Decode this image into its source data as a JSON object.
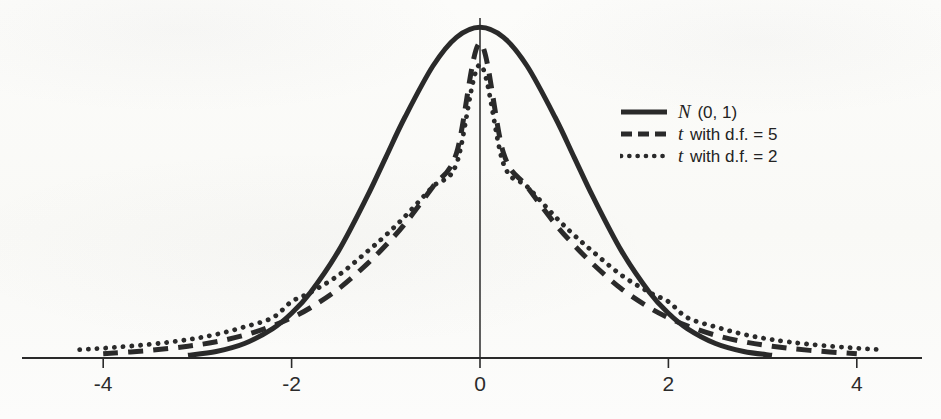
{
  "figure": {
    "ink_color": "#2a2a2a",
    "paper_color": "#fbfbf9"
  },
  "axis": {
    "x_tick_labels": [
      "-4",
      "-2",
      "0",
      "2",
      "4"
    ],
    "x_tick_values": [
      -4,
      -2,
      0,
      2,
      4
    ]
  },
  "legend": {
    "items": [
      {
        "symbol": "N",
        "label": " (0, 1)",
        "style": "solid",
        "dash": "none"
      },
      {
        "symbol": "t",
        "label": " with d.f. = 5",
        "style": "dashed",
        "dash": "14 9"
      },
      {
        "symbol": "t",
        "label": " with d.f. = 2",
        "style": "dotted",
        "dash": "3.5 7"
      }
    ]
  },
  "chart_data": {
    "type": "line",
    "title": "",
    "subtitle": "",
    "xlabel": "",
    "ylabel": "",
    "xlim": [
      -4.9,
      4.7
    ],
    "ylim": [
      0,
      0.41
    ],
    "grid": false,
    "legend_position": "upper right",
    "x_ticks": [
      -4,
      -2,
      0,
      2,
      4
    ],
    "y_ticks": [],
    "series": [
      {
        "name": "N (0, 1)",
        "linestyle": "solid",
        "peak_value": 0.3989,
        "x_range": [
          -3.1,
          3.1
        ],
        "x": [
          -3.1,
          -2.8,
          -2.5,
          -2.2,
          -2.0,
          -1.8,
          -1.5,
          -1.2,
          -1.0,
          -0.8,
          -0.5,
          -0.25,
          0,
          0.25,
          0.5,
          0.8,
          1.0,
          1.2,
          1.5,
          1.8,
          2.0,
          2.2,
          2.5,
          2.8,
          3.1
        ],
        "values": [
          0.0033,
          0.0079,
          0.0175,
          0.0355,
          0.054,
          0.079,
          0.1295,
          0.1942,
          0.242,
          0.2897,
          0.3521,
          0.3867,
          0.3989,
          0.3867,
          0.3521,
          0.2897,
          0.242,
          0.1942,
          0.1295,
          0.079,
          0.054,
          0.0355,
          0.0175,
          0.0079,
          0.0033
        ]
      },
      {
        "name": "t with d.f. = 5",
        "linestyle": "dashed",
        "peak_value": 0.3796,
        "x_range": [
          -4.0,
          4.0
        ],
        "x": [
          -4.0,
          -3.5,
          -3.1,
          -2.8,
          -2.5,
          -2.2,
          -2.0,
          -1.8,
          -1.5,
          -1.2,
          -1.0,
          -0.8,
          -0.5,
          -0.25,
          0,
          0.25,
          0.5,
          0.8,
          1.0,
          1.2,
          1.5,
          1.8,
          2.0,
          2.2,
          2.5,
          2.8,
          3.1,
          3.5,
          4.0
        ],
        "values": [
          0.0051,
          0.0092,
          0.0142,
          0.0196,
          0.0275,
          0.0388,
          0.0486,
          0.0606,
          0.0835,
          0.1132,
          0.136,
          0.1614,
          0.2066,
          0.2468,
          0.3796,
          0.2468,
          0.2066,
          0.1614,
          0.136,
          0.1132,
          0.0835,
          0.0606,
          0.0486,
          0.0388,
          0.0275,
          0.0196,
          0.0142,
          0.0092,
          0.0051
        ]
      },
      {
        "name": "t with d.f. = 2",
        "linestyle": "dotted",
        "peak_value": 0.3536,
        "x_range": [
          -4.25,
          4.25
        ],
        "x": [
          -4.25,
          -4.0,
          -3.5,
          -3.1,
          -2.8,
          -2.5,
          -2.2,
          -2.0,
          -1.8,
          -1.5,
          -1.2,
          -1.0,
          -0.8,
          -0.5,
          -0.25,
          0,
          0.25,
          0.5,
          0.8,
          1.0,
          1.2,
          1.5,
          1.8,
          2.0,
          2.2,
          2.5,
          2.8,
          3.1,
          3.5,
          4.0,
          4.25
        ],
        "values": [
          0.0101,
          0.0118,
          0.0165,
          0.0222,
          0.0285,
          0.0375,
          0.0487,
          0.068,
          0.079,
          0.1,
          0.1281,
          0.1481,
          0.1703,
          0.2067,
          0.234,
          0.3536,
          0.234,
          0.2067,
          0.1703,
          0.1481,
          0.1281,
          0.1,
          0.079,
          0.068,
          0.0487,
          0.0375,
          0.0285,
          0.0222,
          0.0165,
          0.0118,
          0.0101
        ]
      }
    ]
  }
}
